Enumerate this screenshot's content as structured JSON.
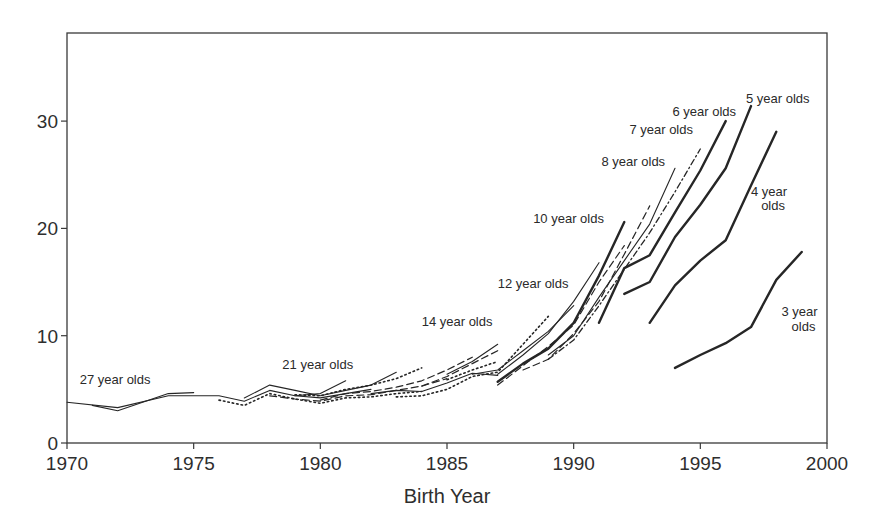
{
  "chart_data": {
    "type": "line",
    "title": "",
    "xlabel": "Birth Year",
    "ylabel": "",
    "xlim": [
      1970,
      2000
    ],
    "ylim": [
      0,
      38
    ],
    "xticks": [
      1970,
      1975,
      1980,
      1985,
      1990,
      1995,
      2000
    ],
    "yticks": [
      0,
      10,
      20,
      30
    ],
    "grid": false,
    "legend": "inline labels",
    "series": [
      {
        "name": "27 year olds",
        "style": "thin",
        "x": [
          1970,
          1972,
          1974,
          1976,
          1977,
          1978,
          1979,
          1980,
          1982
        ],
        "values": [
          3.8,
          3.3,
          4.4,
          4.4,
          3.9,
          4.9,
          4.4,
          4.2,
          5.0
        ]
      },
      {
        "name": "26 year olds",
        "style": "thin",
        "x": [
          1971,
          1972,
          1974,
          1975
        ],
        "values": [
          3.5,
          3.0,
          4.6,
          4.7
        ]
      },
      {
        "name": "25 year olds",
        "style": "dotted",
        "x": [
          1976,
          1977,
          1978,
          1979,
          1980,
          1981,
          1982,
          1983,
          1984
        ],
        "values": [
          4.0,
          3.5,
          4.6,
          4.1,
          3.7,
          4.2,
          4.3,
          4.6,
          4.8
        ]
      },
      {
        "name": "24 year olds",
        "style": "thin",
        "x": [
          1977,
          1978,
          1979,
          1980,
          1981,
          1982,
          1983
        ],
        "values": [
          4.2,
          5.4,
          4.9,
          4.4,
          4.9,
          5.4,
          6.6
        ]
      },
      {
        "name": "23 year olds",
        "style": "dashed",
        "x": [
          1978,
          1979,
          1980,
          1981,
          1982,
          1983,
          1984,
          1985
        ],
        "values": [
          4.4,
          4.1,
          3.9,
          4.4,
          4.5,
          4.9,
          5.3,
          6.0
        ]
      },
      {
        "name": "22 year olds",
        "style": "dotted",
        "x": [
          1979,
          1980,
          1981,
          1982,
          1983,
          1984
        ],
        "values": [
          4.5,
          4.4,
          5.0,
          5.4,
          6.0,
          7.0
        ]
      },
      {
        "name": "21 year olds",
        "style": "thin",
        "x": [
          1979,
          1980,
          1981
        ],
        "values": [
          4.4,
          4.6,
          5.8
        ]
      },
      {
        "name": "20 year olds",
        "style": "dashed",
        "x": [
          1980,
          1981,
          1982,
          1983,
          1984,
          1985,
          1986
        ],
        "values": [
          4.0,
          4.6,
          4.8,
          5.2,
          5.8,
          6.8,
          8.0
        ]
      },
      {
        "name": "19 year olds",
        "style": "thin",
        "x": [
          1982,
          1983,
          1984,
          1985,
          1986,
          1987
        ],
        "values": [
          4.6,
          4.9,
          4.8,
          5.6,
          6.5,
          6.3
        ]
      },
      {
        "name": "18 year olds",
        "style": "dotted",
        "x": [
          1983,
          1984,
          1985,
          1986,
          1987,
          1988,
          1989
        ],
        "values": [
          4.3,
          4.4,
          5.0,
          6.2,
          6.6,
          9.2,
          11.8
        ]
      },
      {
        "name": "16 year olds",
        "style": "dashed",
        "x": [
          1984,
          1985,
          1986,
          1987
        ],
        "values": [
          5.3,
          6.2,
          7.4,
          8.6
        ]
      },
      {
        "name": "15 year olds",
        "style": "thin",
        "x": [
          1985,
          1986,
          1987
        ],
        "values": [
          6.4,
          7.6,
          9.2
        ]
      },
      {
        "name": "14 year olds",
        "style": "dotted",
        "x": [
          1985,
          1986,
          1987
        ],
        "values": [
          5.9,
          6.8,
          7.6
        ]
      },
      {
        "name": "13 year olds",
        "style": "thin",
        "x": [
          1986,
          1987,
          1988,
          1989,
          1990
        ],
        "values": [
          6.4,
          6.8,
          8.6,
          10.4,
          12.8
        ]
      },
      {
        "name": "12 year olds",
        "style": "thin",
        "x": [
          1987,
          1988,
          1989,
          1990,
          1991
        ],
        "values": [
          6.4,
          8.2,
          10.2,
          13.2,
          16.8
        ]
      },
      {
        "name": "11 year olds",
        "style": "dashed",
        "x": [
          1987,
          1988,
          1989,
          1990,
          1991,
          1992
        ],
        "values": [
          5.4,
          7.2,
          9.0,
          11.0,
          15.0,
          18.4
        ]
      },
      {
        "name": "10 year olds",
        "style": "thick",
        "x": [
          1987,
          1988,
          1989,
          1990,
          1991,
          1992
        ],
        "values": [
          5.7,
          7.4,
          8.8,
          11.2,
          15.6,
          20.6
        ]
      },
      {
        "name": "9 year olds",
        "style": "dashed",
        "x": [
          1988,
          1989,
          1990,
          1991,
          1992,
          1993
        ],
        "values": [
          6.8,
          7.8,
          10.2,
          13.2,
          17.6,
          22.1
        ]
      },
      {
        "name": "8 year olds",
        "style": "thin",
        "x": [
          1989,
          1990,
          1991,
          1992,
          1993,
          1994
        ],
        "values": [
          8.2,
          10.0,
          13.6,
          17.0,
          20.4,
          25.6
        ]
      },
      {
        "name": "7 year olds",
        "style": "dashdot",
        "x": [
          1989,
          1990,
          1991,
          1992,
          1993,
          1994,
          1995
        ],
        "values": [
          7.8,
          9.6,
          12.8,
          16.2,
          19.6,
          23.4,
          27.4
        ]
      },
      {
        "name": "6 year olds",
        "style": "thick",
        "x": [
          1991,
          1992,
          1993,
          1994,
          1995,
          1996
        ],
        "values": [
          11.2,
          16.3,
          17.5,
          21.5,
          25.4,
          30.0
        ]
      },
      {
        "name": "5 year olds",
        "style": "thick",
        "x": [
          1992,
          1993,
          1994,
          1995,
          1996,
          1997
        ],
        "values": [
          13.9,
          15.0,
          19.2,
          22.2,
          25.6,
          31.4
        ]
      },
      {
        "name": "4 year olds",
        "style": "thick",
        "x": [
          1993,
          1994,
          1995,
          1996,
          1997,
          1998
        ],
        "values": [
          11.2,
          14.7,
          17.0,
          18.9,
          24.0,
          29.0
        ]
      },
      {
        "name": "3 year olds",
        "style": "thick",
        "x": [
          1994,
          1995,
          1996,
          1997,
          1998,
          1999
        ],
        "values": [
          7.0,
          8.2,
          9.3,
          10.8,
          15.2,
          17.8
        ]
      }
    ],
    "annotations": [
      {
        "text": "27 year olds",
        "x": 1970.5,
        "y": 5.5
      },
      {
        "text": "21 year olds",
        "x": 1978.5,
        "y": 6.9
      },
      {
        "text": "14 year olds",
        "x": 1984.0,
        "y": 10.9
      },
      {
        "text": "12 year olds",
        "x": 1987.0,
        "y": 14.4
      },
      {
        "text": "10 year olds",
        "x": 1988.4,
        "y": 20.5
      },
      {
        "text": "8 year olds",
        "x": 1991.1,
        "y": 25.8
      },
      {
        "text": "7 year olds",
        "x": 1992.2,
        "y": 28.8
      },
      {
        "text": "6 year olds",
        "x": 1993.9,
        "y": 30.5
      },
      {
        "text": "5 year olds",
        "x": 1996.8,
        "y": 31.7
      },
      {
        "text": "4 year",
        "x": 1997.0,
        "y": 23.0
      },
      {
        "text": "olds",
        "x": 1997.4,
        "y": 21.7
      },
      {
        "text": "3 year",
        "x": 1998.2,
        "y": 11.8
      },
      {
        "text": "olds",
        "x": 1998.6,
        "y": 10.4
      }
    ]
  },
  "colors": {
    "line": "#262626",
    "axis": "#3a3a3a",
    "text": "#2e2e2e",
    "background": "#ffffff"
  }
}
